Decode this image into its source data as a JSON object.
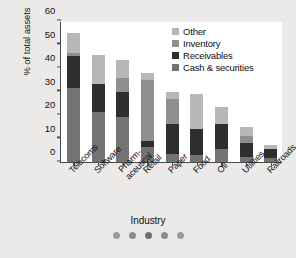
{
  "chart_data": {
    "type": "bar",
    "stacked": true,
    "title": "",
    "xlabel": "Industry",
    "ylabel": "% of total assets",
    "ylim": [
      0,
      60
    ],
    "yticks": [
      0,
      10,
      20,
      30,
      40,
      50,
      60
    ],
    "grid": false,
    "legend_position": "top-right",
    "categories": [
      "Telecoms",
      "Software",
      "Pharm-\naceutical",
      "Retail",
      "Paper",
      "Food",
      "Oil",
      "Utilities",
      "Railroads"
    ],
    "category_lines": [
      [
        "Telecoms"
      ],
      [
        "Software"
      ],
      [
        "Pharm-",
        "aceutical"
      ],
      [
        "Retail"
      ],
      [
        "Paper"
      ],
      [
        "Food"
      ],
      [
        "Oil"
      ],
      [
        "Utilities"
      ],
      [
        "Railroads"
      ]
    ],
    "series": [
      {
        "name": "Cash & securities",
        "color": "#737373",
        "values": [
          31.3,
          21.2,
          19.0,
          6.4,
          3.6,
          3.1,
          5.5,
          2.2,
          1.6
        ]
      },
      {
        "name": "Receivables",
        "color": "#2e2e2e",
        "values": [
          13.7,
          11.8,
          10.6,
          2.7,
          12.4,
          10.8,
          10.6,
          5.8,
          3.9
        ]
      },
      {
        "name": "Inventory",
        "color": "#8f8f8f",
        "values": [
          1.5,
          0.0,
          6.3,
          26.0,
          11.0,
          0.0,
          0.0,
          3.0,
          0.0
        ]
      },
      {
        "name": "Other",
        "color": "#b7b7b7",
        "values": [
          8.5,
          12.5,
          7.6,
          2.8,
          3.0,
          15.1,
          7.3,
          3.7,
          1.8
        ]
      }
    ],
    "totals": [
      55.0,
      45.5,
      43.5,
      37.9,
      30.0,
      29.0,
      23.4,
      14.7,
      7.3
    ],
    "legend_order": [
      "Other",
      "Inventory",
      "Receivables",
      "Cash & securities"
    ]
  },
  "decoration": {
    "dots": [
      {
        "name": "dot-1",
        "color": "#9a9a9a"
      },
      {
        "name": "dot-2",
        "color": "#8d8d8d"
      },
      {
        "name": "dot-3",
        "color": "#6e6e6e"
      },
      {
        "name": "dot-4",
        "color": "#8d8d8d"
      },
      {
        "name": "dot-5",
        "color": "#9a9a9a"
      }
    ]
  },
  "colors": {
    "page_background": "#eceae8",
    "plot_background": "#ffffff",
    "axis": "#4a4a4a",
    "text": "#111111"
  }
}
